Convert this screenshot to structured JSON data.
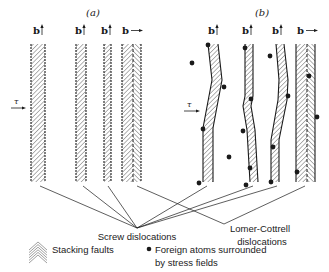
{
  "panels": {
    "a": {
      "label": "(a)",
      "label_pos": [
        93,
        16
      ]
    },
    "b": {
      "label": "(b)",
      "label_pos": [
        262,
        16
      ]
    }
  },
  "burgers_symbol": "b",
  "shear_stress_symbol": "τ",
  "shear_arrows": [
    {
      "panel": "a",
      "x1": 11,
      "x2": 26,
      "y": 108,
      "label_x": 14,
      "label_y": 104
    },
    {
      "panel": "b",
      "x1": 184,
      "x2": 200,
      "y": 111,
      "label_x": 187,
      "label_y": 107
    }
  ],
  "strips": [
    {
      "panel": "a",
      "type": "screw",
      "b_dir": "up",
      "b_x": 33,
      "b_y": 34,
      "left": [
        [
          31,
          44
        ],
        [
          31,
          182
        ]
      ],
      "right": [
        [
          45,
          44
        ],
        [
          45,
          182
        ]
      ]
    },
    {
      "panel": "a",
      "type": "screw",
      "b_dir": "up",
      "b_x": 75,
      "b_y": 34,
      "left": [
        [
          76,
          44
        ],
        [
          76,
          182
        ]
      ],
      "right": [
        [
          86,
          44
        ],
        [
          86,
          182
        ]
      ]
    },
    {
      "panel": "a",
      "type": "screw",
      "b_dir": "up",
      "b_x": 101,
      "b_y": 34,
      "left": [
        [
          104,
          44
        ],
        [
          104,
          182
        ]
      ],
      "right": [
        [
          111,
          44
        ],
        [
          111,
          182
        ]
      ]
    },
    {
      "panel": "a",
      "type": "lomer-cottrell",
      "b_dir": "right",
      "b_x": 122,
      "b_y": 34,
      "left": [
        [
          122,
          44
        ],
        [
          122,
          182
        ]
      ],
      "right": [
        [
          141,
          44
        ],
        [
          141,
          182
        ]
      ],
      "center": 133
    },
    {
      "panel": "b",
      "type": "screw",
      "b_dir": "up",
      "b_x": 208,
      "b_y": 34,
      "left": [
        [
          208,
          44
        ],
        [
          212,
          80
        ],
        [
          209,
          96
        ],
        [
          203,
          128
        ],
        [
          203,
          182
        ]
      ],
      "right": [
        [
          218,
          44
        ],
        [
          222,
          80
        ],
        [
          219,
          96
        ],
        [
          213,
          128
        ],
        [
          213,
          182
        ]
      ]
    },
    {
      "panel": "b",
      "type": "screw",
      "b_dir": "up",
      "b_x": 242,
      "b_y": 34,
      "left": [
        [
          245,
          44
        ],
        [
          245,
          96
        ],
        [
          243,
          106
        ],
        [
          247,
          130
        ],
        [
          250,
          182
        ]
      ],
      "right": [
        [
          253,
          44
        ],
        [
          253,
          96
        ],
        [
          251,
          106
        ],
        [
          255,
          130
        ],
        [
          258,
          182
        ]
      ]
    },
    {
      "panel": "b",
      "type": "screw",
      "b_dir": "up",
      "b_x": 272,
      "b_y": 34,
      "left": [
        [
          276,
          44
        ],
        [
          279,
          80
        ],
        [
          278,
          100
        ],
        [
          271,
          140
        ],
        [
          271,
          182
        ]
      ],
      "right": [
        [
          284,
          44
        ],
        [
          288,
          80
        ],
        [
          287,
          100
        ],
        [
          279,
          140
        ],
        [
          279,
          182
        ]
      ]
    },
    {
      "panel": "b",
      "type": "lomer-cottrell",
      "b_dir": "right",
      "b_x": 297,
      "b_y": 34,
      "left": [
        [
          296,
          44
        ],
        [
          296,
          182
        ]
      ],
      "right": [
        [
          315,
          44
        ],
        [
          315,
          182
        ]
      ],
      "center": 307
    }
  ],
  "foreign_atoms": [
    [
      208,
      45
    ],
    [
      192,
      63
    ],
    [
      224,
      87
    ],
    [
      203,
      129
    ],
    [
      199,
      183
    ],
    [
      229,
      157
    ],
    [
      245,
      48
    ],
    [
      251,
      99
    ],
    [
      243,
      131
    ],
    [
      250,
      168
    ],
    [
      246,
      185
    ],
    [
      270,
      56
    ],
    [
      288,
      96
    ],
    [
      273,
      147
    ],
    [
      271,
      182
    ],
    [
      309,
      76
    ],
    [
      317,
      117
    ],
    [
      297,
      172
    ]
  ],
  "leader_lines": {
    "screw": {
      "target": [
        137,
        228
      ],
      "sources": [
        [
          40,
          186
        ],
        [
          83,
          186
        ],
        [
          108,
          186
        ],
        [
          207,
          186
        ],
        [
          253,
          186
        ],
        [
          277,
          186
        ]
      ]
    },
    "lomer_cottrell": {
      "target": [
        224,
        224
      ],
      "sources": [
        [
          137,
          186
        ],
        [
          305,
          186
        ]
      ]
    }
  },
  "labels": {
    "screw": {
      "text": "Screw dislocations",
      "x": 137,
      "y": 240
    },
    "lomer_cottrell_line1": {
      "text": "Lomer-Cottrell",
      "x": 260,
      "y": 232
    },
    "lomer_cottrell_line2": {
      "text": "dislocations",
      "x": 262,
      "y": 245
    }
  },
  "legend": {
    "stacking_faults": {
      "text": "Stacking faults",
      "swatch_x": 29,
      "swatch_y": 242,
      "text_x": 52,
      "text_y": 253
    },
    "foreign_atoms_line1": {
      "text": "Foreign atoms surrounded",
      "dot_x": 149,
      "dot_y": 249,
      "text_x": 155,
      "text_y": 253
    },
    "foreign_atoms_line2": {
      "text": "by stress fields",
      "text_x": 155,
      "text_y": 266
    }
  },
  "colors": {
    "ink": "#1a1a1a",
    "hatch": "#555555",
    "background": "#ffffff"
  }
}
